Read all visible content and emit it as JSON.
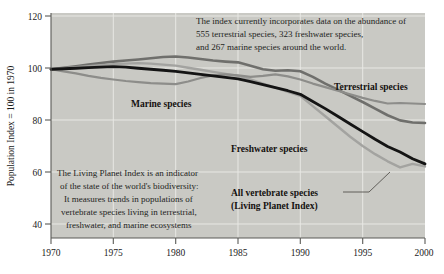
{
  "chart_data": {
    "type": "line",
    "title": "",
    "xlabel": "",
    "ylabel": "Population Index = 100 in 1970",
    "xlim": [
      1970,
      2000
    ],
    "ylim": [
      34,
      122
    ],
    "grid": true,
    "legend_position": "inline-labels",
    "x_ticks": [
      "1970",
      "1975",
      "1980",
      "1985",
      "1990",
      "1995",
      "2000"
    ],
    "y_ticks": [
      "40",
      "60",
      "80",
      "100",
      "120"
    ],
    "x": [
      1970,
      1971,
      1972,
      1973,
      1974,
      1975,
      1976,
      1977,
      1978,
      1979,
      1980,
      1981,
      1982,
      1983,
      1984,
      1985,
      1986,
      1987,
      1988,
      1989,
      1990,
      1991,
      1992,
      1993,
      1994,
      1995,
      1996,
      1997,
      1998,
      1999,
      2000
    ],
    "series": [
      {
        "name": "Terrestrial species",
        "color": "#6f6f6c",
        "width": 2.6,
        "values": [
          100,
          100.6,
          101.2,
          101.8,
          102.4,
          103,
          103.4,
          103.8,
          104.3,
          104.8,
          105,
          104.6,
          104.0,
          103.4,
          103.0,
          102.7,
          101.4,
          100.0,
          99.4,
          99.6,
          99.2,
          97.0,
          94.4,
          92.0,
          89.6,
          87.2,
          84.6,
          82.0,
          80.0,
          79.2,
          79.0
        ]
      },
      {
        "name": "Marine species",
        "color": "#8d8d8a",
        "width": 2.2,
        "values": [
          100,
          99.2,
          98.4,
          97.4,
          96.6,
          96.0,
          95.4,
          95.0,
          94.6,
          94.4,
          94.2,
          95.2,
          96.6,
          97.6,
          98.0,
          97.6,
          97.0,
          97.4,
          98.0,
          97.2,
          96.0,
          94.4,
          93.0,
          91.6,
          90.2,
          88.8,
          87.6,
          86.6,
          86.8,
          86.6,
          86.4
        ]
      },
      {
        "name": "All vertebrate species (Living Planet Index)",
        "color": "#141414",
        "width": 2.8,
        "values": [
          100,
          100.2,
          100.4,
          100.6,
          100.8,
          101,
          100.8,
          100.4,
          100.0,
          99.6,
          99.2,
          98.6,
          98.0,
          97.4,
          96.8,
          96.2,
          95.2,
          94.0,
          92.8,
          91.6,
          90.2,
          87.4,
          84.6,
          81.6,
          78.6,
          75.6,
          72.6,
          69.8,
          67.6,
          65.0,
          63.0
        ]
      },
      {
        "name": "Freshwater species",
        "color": "#a3a3a0",
        "width": 2.4,
        "values": [
          100,
          100.4,
          100.8,
          101.2,
          101.6,
          102,
          102.2,
          102.4,
          102.2,
          101.8,
          101.4,
          100.6,
          99.8,
          99.0,
          98.2,
          97.4,
          96.0,
          94.4,
          92.8,
          91.2,
          89.6,
          85.6,
          81.6,
          77.6,
          73.6,
          70.0,
          66.8,
          64.0,
          61.6,
          63.0,
          62.0
        ]
      }
    ],
    "annotations": [
      {
        "id": "top-note",
        "lines": [
          "The index currently incorporates data on the abundance of",
          "555 terrestrial species, 323 freshwater species,",
          "and 267 marine species around the world."
        ]
      },
      {
        "id": "bottom-note",
        "lines": [
          "The Living Planet Index is an indicator",
          "of the state of the world's biodiversity:",
          "It measures trends in populations of",
          "vertebrate species living in terrestrial,",
          "freshwater, and marine ecosystems"
        ]
      }
    ],
    "series_labels": [
      {
        "id": "terrestrial",
        "text": "Terrestrial species"
      },
      {
        "id": "marine",
        "text": "Marine species"
      },
      {
        "id": "freshwater",
        "text": "Freshwater species"
      },
      {
        "id": "all-vertebrates-line1",
        "text": "All vertebrate species"
      },
      {
        "id": "all-vertebrates-line2",
        "text": "(Living Planet Index)"
      }
    ],
    "colors": {
      "plot_background": "#c9c9c4",
      "gridline": "#e8e8e4",
      "axis": "#5a5a56",
      "text": "#1a1a1a"
    }
  }
}
